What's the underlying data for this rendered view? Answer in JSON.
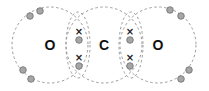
{
  "diagram": {
    "atoms": [
      {
        "symbol": "O",
        "role": "left-oxygen"
      },
      {
        "symbol": "C",
        "role": "central-carbon"
      },
      {
        "symbol": "O",
        "role": "right-oxygen"
      }
    ],
    "bond_markers": {
      "cross": "×"
    },
    "colors": {
      "shell_stroke": "#9a9a9a",
      "dot_fill": "#a6a6a6",
      "dot_stroke": "#6e6e6e",
      "text": "#111111"
    }
  }
}
